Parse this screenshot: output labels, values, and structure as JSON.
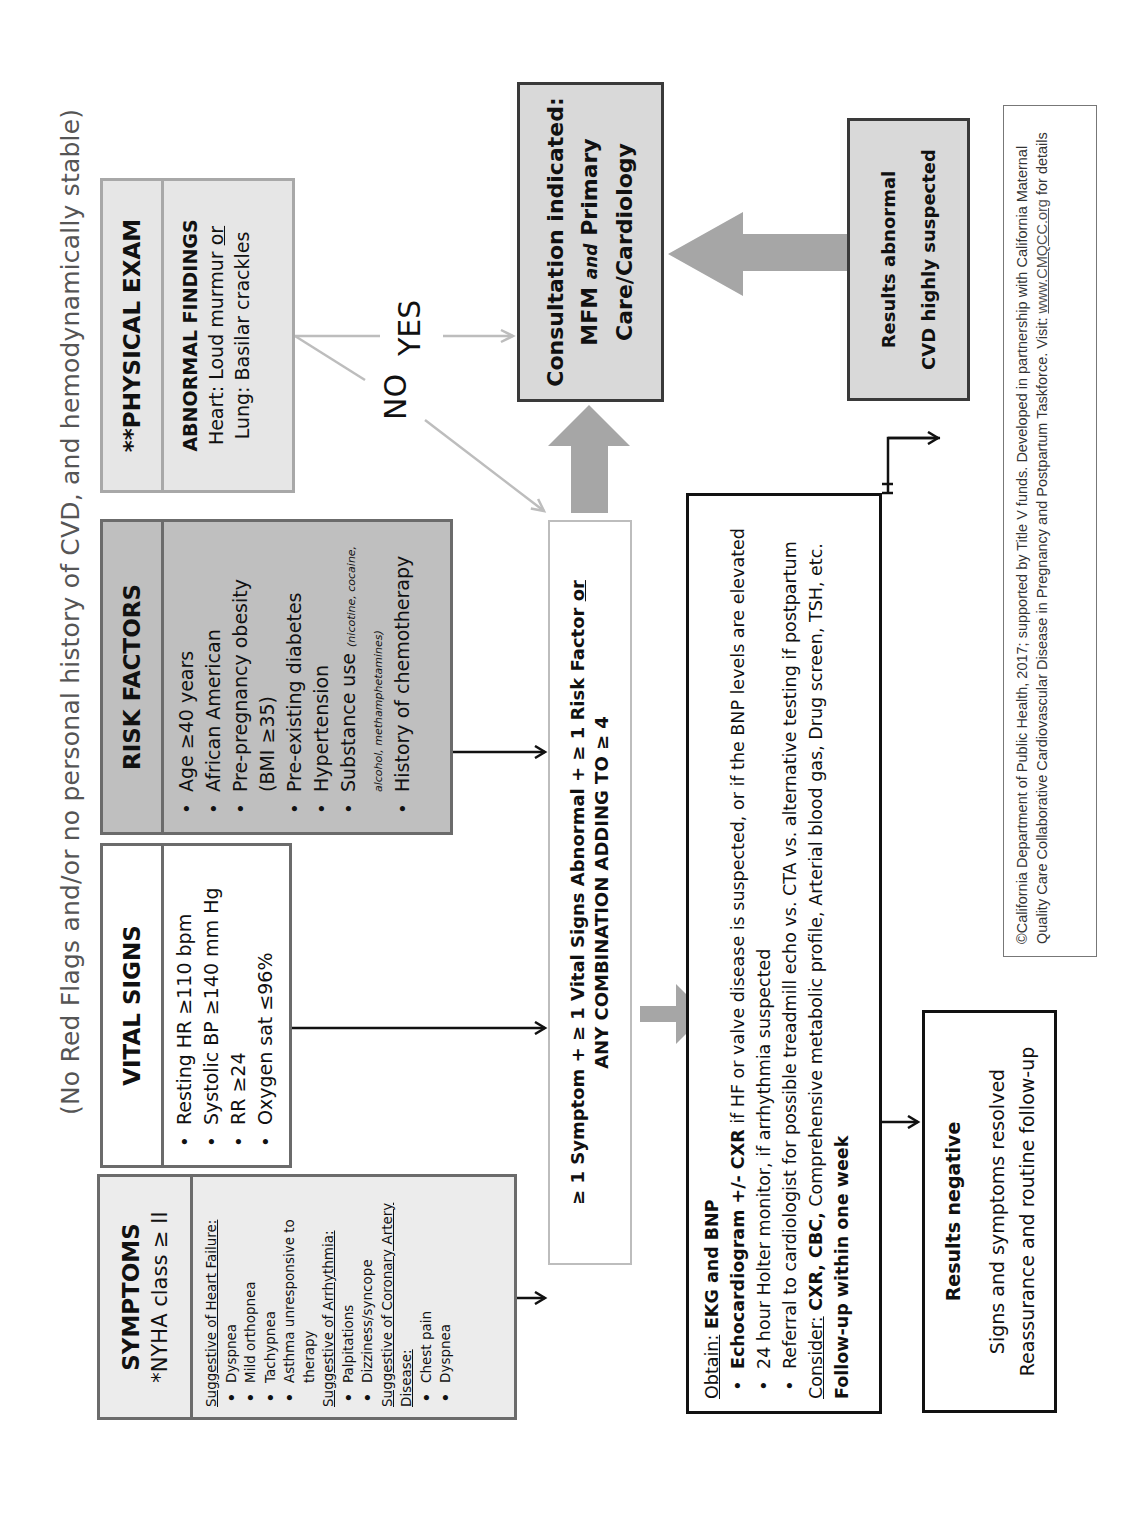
{
  "title": "(No Red Flags and/or no personal history of CVD, and hemodynamically stable)",
  "symptoms": {
    "title": "SYMPTOMS",
    "subtitle": "*NYHA class ≥ II",
    "sections": [
      {
        "heading": "Suggestive of Heart Failure:",
        "items": [
          "Dyspnea",
          "Mild orthopnea",
          "Tachypnea",
          "Asthma unresponsive to therapy"
        ]
      },
      {
        "heading": "Suggestive of Arrhythmia:",
        "items": [
          "Palpitations",
          "Dizziness/syncope"
        ]
      },
      {
        "heading": "Suggestive of Coronary Artery Disease:",
        "items": [
          "Chest pain",
          "Dyspnea"
        ]
      }
    ]
  },
  "vital_signs": {
    "title": "VITAL SIGNS",
    "items": [
      "Resting HR ≥110 bpm",
      "Systolic BP ≥140 mm Hg",
      "RR ≥24",
      "Oxygen sat ≤96%"
    ]
  },
  "risk_factors": {
    "title": "RISK FACTORS",
    "items": [
      "Age ≥40 years",
      "African American",
      "Pre-pregnancy obesity (BMI ≥35)",
      "Pre-existing diabetes",
      "Hypertension",
      "Substance use",
      "History of chemotherapy"
    ],
    "substance_note": "(nicotine, cocaine, alcohol, methamphetamines)"
  },
  "physical_exam": {
    "title": "**PHYSICAL EXAM",
    "findings_label": "ABNORMAL FINDINGS",
    "heart_prefix": "Heart: Loud murmur ",
    "heart_or": "or",
    "lung": "Lung: Basilar crackles"
  },
  "decision": {
    "yes": "YES",
    "no": "NO"
  },
  "criteria": {
    "line1_a": "≥ 1 Symptom + ≥ 1 Vital Signs Abnormal + ≥ 1 Risk Factor ",
    "line1_or": "or",
    "line2": "ANY COMBINATION ADDING TO ≥ 4"
  },
  "consultation": {
    "line1": "Consultation indicated:",
    "mfm": "MFM",
    "and": "and",
    "primary": "Primary",
    "line3": "Care/Cardiology"
  },
  "workup": {
    "obtain_label": "Obtain:",
    "obtain_value": "EKG and BNP",
    "items": [
      {
        "bold": "Echocardiogram +/- CXR",
        "text": " if HF or valve disease is suspected, or if the BNP levels are elevated"
      },
      {
        "bold": "",
        "text": "24 hour Holter monitor, if arrhythmia suspected"
      },
      {
        "bold": "",
        "text": "Referral to cardiologist for possible treadmill echo vs. CTA vs. alternative testing if postpartum"
      }
    ],
    "consider_label": "Consider:",
    "consider_bold": "CXR, CBC,",
    "consider_text": " Comprehensive metabolic profile, Arterial blood gas, Drug screen, TSH, etc.",
    "followup": "Follow-up within one week"
  },
  "results_abnormal": {
    "line1": "Results abnormal",
    "line2": "CVD highly suspected"
  },
  "results_negative": {
    "title": "Results negative",
    "line1": "Signs and symptoms resolved",
    "line2": "Reassurance and routine follow-up"
  },
  "footer": {
    "text": "©California Department of Public Health, 2017; supported by Title V funds. Developed in partnership with California Maternal Quality Care Collaborative Cardiovascular Disease in Pregnancy and Postpartum Taskforce. Visit: ",
    "link": "www.CMQCC.org",
    "suffix": " for details"
  },
  "colors": {
    "box_gray": "#d9d9d9",
    "box_light": "#ececec",
    "risk_gray": "#bfbfbf",
    "arrow_gray": "#a6a6a6",
    "line_light": "#bdbdbd"
  }
}
